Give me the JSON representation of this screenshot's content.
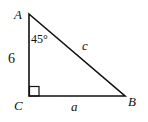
{
  "diagram": {
    "type": "right-triangle",
    "vertices": {
      "A": {
        "label": "A",
        "x": 29,
        "y": 14
      },
      "B": {
        "label": "B",
        "x": 125,
        "y": 96
      },
      "C": {
        "label": "C",
        "x": 29,
        "y": 96
      }
    },
    "sides": {
      "AC": {
        "label": "6"
      },
      "CB": {
        "label": "a"
      },
      "AB": {
        "label": "c"
      }
    },
    "angles": {
      "A": {
        "label": "45°"
      },
      "C": {
        "right_angle": true
      }
    },
    "stroke_color": "#111111",
    "background": "#ffffff"
  }
}
